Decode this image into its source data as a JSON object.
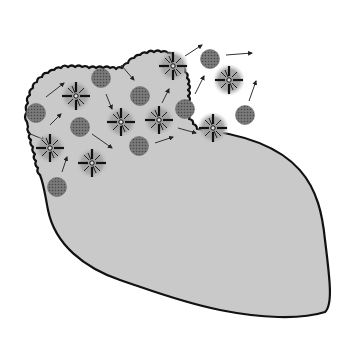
{
  "diagram": {
    "colors": {
      "background": "#ffffff",
      "tissue_fill": "#c8c8c8",
      "outline": "#111111",
      "starburst_halo": "#8a8a8a",
      "starburst_rays": "#111111",
      "dotted_cell": "#6e6e6e",
      "arrow": "#333333"
    },
    "starburst_cells": [
      {
        "x": 76,
        "y": 96
      },
      {
        "x": 173,
        "y": 66
      },
      {
        "x": 229,
        "y": 80
      },
      {
        "x": 121,
        "y": 122
      },
      {
        "x": 159,
        "y": 120
      },
      {
        "x": 213,
        "y": 128
      },
      {
        "x": 50,
        "y": 148
      },
      {
        "x": 92,
        "y": 163
      }
    ],
    "dotted_cells": [
      {
        "x": 36,
        "y": 113
      },
      {
        "x": 101,
        "y": 78
      },
      {
        "x": 140,
        "y": 96
      },
      {
        "x": 210,
        "y": 59
      },
      {
        "x": 185,
        "y": 109
      },
      {
        "x": 80,
        "y": 127
      },
      {
        "x": 245,
        "y": 115
      },
      {
        "x": 139,
        "y": 146
      },
      {
        "x": 57,
        "y": 187
      }
    ],
    "arrows": [
      {
        "x1": 46,
        "y1": 97,
        "x2": 64,
        "y2": 83
      },
      {
        "x1": 50,
        "y1": 125,
        "x2": 61,
        "y2": 114
      },
      {
        "x1": 28,
        "y1": 133,
        "x2": 45,
        "y2": 140
      },
      {
        "x1": 62,
        "y1": 172,
        "x2": 67,
        "y2": 157
      },
      {
        "x1": 92,
        "y1": 134,
        "x2": 112,
        "y2": 148
      },
      {
        "x1": 121,
        "y1": 65,
        "x2": 134,
        "y2": 80
      },
      {
        "x1": 106,
        "y1": 94,
        "x2": 112,
        "y2": 109
      },
      {
        "x1": 155,
        "y1": 143,
        "x2": 173,
        "y2": 137
      },
      {
        "x1": 178,
        "y1": 128,
        "x2": 196,
        "y2": 133
      },
      {
        "x1": 162,
        "y1": 103,
        "x2": 169,
        "y2": 89
      },
      {
        "x1": 185,
        "y1": 56,
        "x2": 202,
        "y2": 45
      },
      {
        "x1": 195,
        "y1": 94,
        "x2": 204,
        "y2": 76
      },
      {
        "x1": 226,
        "y1": 55,
        "x2": 252,
        "y2": 53
      },
      {
        "x1": 249,
        "y1": 101,
        "x2": 256,
        "y2": 81
      }
    ]
  }
}
